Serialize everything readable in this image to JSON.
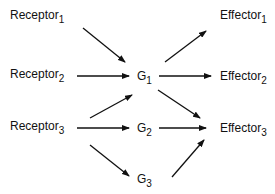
{
  "diagram": {
    "receptors": [
      {
        "label": "Receptor",
        "sub": "1"
      },
      {
        "label": "Receptor",
        "sub": "2"
      },
      {
        "label": "Receptor",
        "sub": "3"
      }
    ],
    "g_proteins": [
      {
        "label": "G",
        "sub": "1"
      },
      {
        "label": "G",
        "sub": "2"
      },
      {
        "label": "G",
        "sub": "3"
      }
    ],
    "effectors": [
      {
        "label": "Effector",
        "sub": "1"
      },
      {
        "label": "Effector",
        "sub": "2"
      },
      {
        "label": "Effector",
        "sub": "3"
      }
    ],
    "edges": [
      {
        "from": "Receptor1",
        "to": "G1"
      },
      {
        "from": "Receptor2",
        "to": "G1"
      },
      {
        "from": "Receptor3",
        "to": "G1"
      },
      {
        "from": "Receptor3",
        "to": "G2"
      },
      {
        "from": "Receptor3",
        "to": "G3"
      },
      {
        "from": "G1",
        "to": "Effector1"
      },
      {
        "from": "G1",
        "to": "Effector2"
      },
      {
        "from": "G1",
        "to": "Effector3"
      },
      {
        "from": "G2",
        "to": "Effector3"
      },
      {
        "from": "G3",
        "to": "Effector3"
      }
    ],
    "colors": {
      "line": "#111111",
      "background": "#ffffff"
    }
  }
}
